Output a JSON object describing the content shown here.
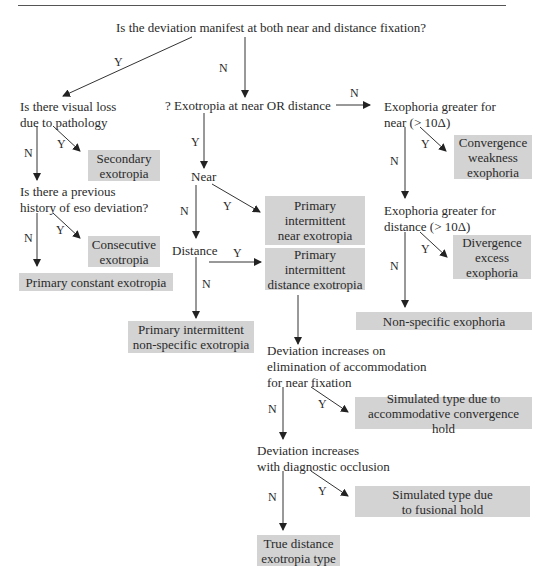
{
  "questions": {
    "root": "Is the deviation manifest at both near and distance fixation?",
    "visual_loss": [
      "Is there visual loss",
      "due to pathology"
    ],
    "eso_history": [
      "Is there a previous",
      "history of eso deviation?"
    ],
    "exotropia_near_or_distance": "? Exotropia at near OR distance",
    "near": "Near",
    "distance": "Distance",
    "exophoria_near": [
      "Exophoria greater for",
      "near (> 10Δ)"
    ],
    "exophoria_distance": [
      "Exophoria greater for",
      "distance (> 10Δ)"
    ],
    "accommodation": [
      "Deviation increases on",
      "elimination of accommodation",
      "for near fixation"
    ],
    "occlusion": [
      "Deviation increases",
      "with diagnostic occlusion"
    ]
  },
  "outcomes": {
    "secondary": [
      "Secondary",
      "exotropia"
    ],
    "consecutive": [
      "Consecutive",
      "exotropia"
    ],
    "primary_constant": [
      "Primary constant exotropia"
    ],
    "intermittent_near": [
      "Primary",
      "intermittent",
      "near exotropia"
    ],
    "intermittent_distance": [
      "Primary",
      "intermittent",
      "distance exotropia"
    ],
    "intermittent_nonspecific": [
      "Primary intermittent",
      "non-specific exotropia"
    ],
    "convergence_weakness": [
      "Convergence",
      "weakness",
      "exophoria"
    ],
    "divergence_excess": [
      "Divergence",
      "excess",
      "exophoria"
    ],
    "nonspecific_exophoria": [
      "Non-specific exophoria"
    ],
    "simulated_accommodative": [
      "Simulated type due to",
      "accommodative convergence hold"
    ],
    "simulated_fusional": [
      "Simulated type due",
      "to fusional hold"
    ],
    "true_distance": [
      "True distance",
      "exotropia type"
    ]
  },
  "edge_labels": {
    "yes": "Y",
    "no": "N"
  },
  "colors": {
    "box_fill": "#d3d3d3",
    "text": "#2a2a2a",
    "line": "#333333"
  }
}
